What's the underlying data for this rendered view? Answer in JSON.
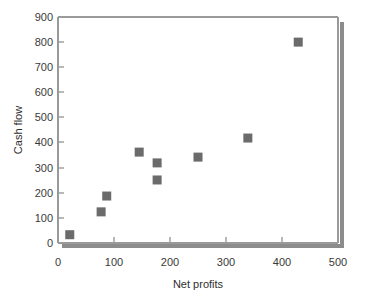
{
  "chart_data": {
    "type": "scatter",
    "title": "",
    "xlabel": "Net profits",
    "ylabel": "Cash flow",
    "xlim": [
      0,
      500
    ],
    "ylim": [
      0,
      900
    ],
    "xticks": [
      "0",
      "100",
      "200",
      "300",
      "400",
      "500"
    ],
    "yticks": [
      "0",
      "100",
      "200",
      "300",
      "400",
      "500",
      "600",
      "700",
      "800",
      "900"
    ],
    "grid": false,
    "legend": null,
    "marker": "square",
    "marker_color": "#6b6b6b",
    "points": [
      {
        "x": 21,
        "y": 33
      },
      {
        "x": 77,
        "y": 124
      },
      {
        "x": 87,
        "y": 187
      },
      {
        "x": 145,
        "y": 362
      },
      {
        "x": 177,
        "y": 319
      },
      {
        "x": 177,
        "y": 251
      },
      {
        "x": 250,
        "y": 342
      },
      {
        "x": 339,
        "y": 418
      },
      {
        "x": 429,
        "y": 800
      }
    ]
  },
  "colors": {
    "axis": "#9a9a9a",
    "shadow": "#8c8c8c",
    "marker": "#6b6b6b",
    "text": "#3a3a3a",
    "background": "#ffffff"
  }
}
